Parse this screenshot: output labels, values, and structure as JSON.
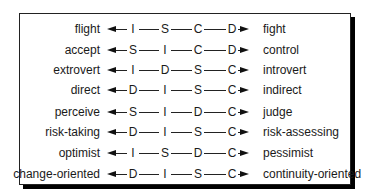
{
  "diagram": {
    "title": "",
    "rows": [
      {
        "left": "flight",
        "right": "fight",
        "sequence": [
          "I",
          "S",
          "C",
          "D"
        ]
      },
      {
        "left": "accept",
        "right": "control",
        "sequence": [
          "S",
          "I",
          "C",
          "D"
        ]
      },
      {
        "left": "extrovert",
        "right": "introvert",
        "sequence": [
          "I",
          "D",
          "S",
          "C"
        ]
      },
      {
        "left": "direct",
        "right": "indirect",
        "sequence": [
          "D",
          "I",
          "S",
          "C"
        ]
      },
      {
        "left": "perceive",
        "right": "judge",
        "sequence": [
          "S",
          "I",
          "D",
          "C"
        ]
      },
      {
        "left": "risk-taking",
        "right": "risk-assessing",
        "sequence": [
          "D",
          "I",
          "S",
          "C"
        ]
      },
      {
        "left": "optimist",
        "right": "pessimist",
        "sequence": [
          "I",
          "S",
          "D",
          "C"
        ]
      },
      {
        "left": "change-oriented",
        "right": "continuity-oriented",
        "sequence": [
          "D",
          "I",
          "S",
          "C"
        ]
      }
    ],
    "icons": {
      "left_arrow": "arrow-left-icon",
      "right_arrow": "arrow-right-icon"
    },
    "colors": {
      "line": "#222222",
      "text": "#1a1a1a",
      "shadow": "#000000",
      "background": "#ffffff"
    }
  }
}
